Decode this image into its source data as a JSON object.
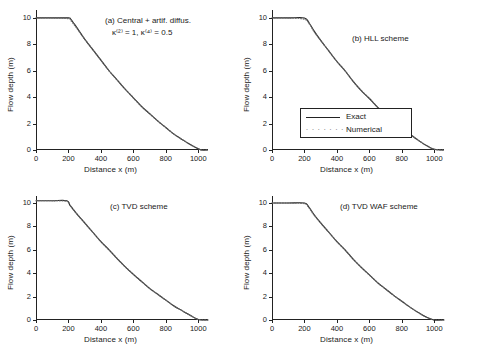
{
  "figure": {
    "background": "#ffffff",
    "line_color": "#222222",
    "marker_color": "#666666"
  },
  "axes": {
    "xlabel": "Distance x (m)",
    "ylabel": "Flow depth (m)",
    "xticks": [
      "0",
      "200",
      "400",
      "600",
      "800",
      "1000"
    ],
    "yticks": [
      "0",
      "2",
      "4",
      "6",
      "8",
      "10"
    ],
    "xlim": [
      0,
      1060
    ],
    "ylim": [
      0,
      10.6
    ]
  },
  "panels": [
    {
      "id": "a",
      "label": "(a) Central + artif. diffus.",
      "sublabel": "κ⁽²⁾ = 1, κ⁽⁴⁾ = 0.5",
      "has_legend": false
    },
    {
      "id": "b",
      "label": "(b) HLL scheme",
      "sublabel": "",
      "has_legend": true
    },
    {
      "id": "c",
      "label": "(c) TVD scheme",
      "sublabel": "",
      "has_legend": false
    },
    {
      "id": "d",
      "label": "(d) TVD WAF scheme",
      "sublabel": "",
      "has_legend": false
    }
  ],
  "legend": {
    "entries": [
      {
        "label": "Exact",
        "style": "line"
      },
      {
        "label": "Numerical",
        "style": "dots"
      }
    ]
  },
  "chart_data": {
    "type": "line",
    "title": "",
    "xlabel": "Distance x (m)",
    "ylabel": "Flow depth (m)",
    "xlim": [
      0,
      1060
    ],
    "ylim": [
      0,
      10.6
    ],
    "grid": false,
    "legend_position": "panel-b-center-left",
    "panels": [
      {
        "id": "a",
        "label": "(a) Central + artif. diffus.",
        "sublabel": "κ⁽²⁾ = 1, κ⁽⁴⁾ = 0.5",
        "series": [
          {
            "name": "Exact",
            "style": "solid-line",
            "x": [
              0,
              100,
              200,
              215,
              250,
              300,
              350,
              400,
              450,
              500,
              550,
              600,
              650,
              700,
              750,
              800,
              850,
              900,
              950,
              1000,
              1020,
              1060
            ],
            "y": [
              10.0,
              10.0,
              10.0,
              9.9,
              9.3,
              8.4,
              7.6,
              6.8,
              6.0,
              5.3,
              4.6,
              3.95,
              3.3,
              2.75,
              2.2,
              1.7,
              1.2,
              0.8,
              0.42,
              0.1,
              0.0,
              0.0
            ]
          },
          {
            "name": "Numerical",
            "style": "dotted-markers",
            "x": [
              0,
              100,
              200,
              215,
              250,
              300,
              350,
              400,
              450,
              500,
              550,
              600,
              650,
              700,
              750,
              800,
              850,
              900,
              950,
              1000,
              1020,
              1060
            ],
            "y": [
              10.0,
              10.0,
              9.95,
              9.8,
              9.25,
              8.4,
              7.6,
              6.8,
              6.0,
              5.3,
              4.6,
              3.95,
              3.3,
              2.75,
              2.2,
              1.7,
              1.2,
              0.8,
              0.42,
              0.1,
              0.0,
              0.0
            ]
          }
        ]
      },
      {
        "id": "b",
        "label": "(b) HLL scheme",
        "sublabel": "",
        "series": [
          {
            "name": "Exact",
            "style": "solid-line",
            "x": [
              0,
              100,
              200,
              230,
              260,
              300,
              350,
              400,
              450,
              500,
              550,
              600,
              650,
              700,
              750,
              800,
              850,
              900,
              950,
              1000,
              1060
            ],
            "y": [
              10.0,
              10.0,
              10.0,
              9.6,
              9.0,
              8.3,
              7.5,
              6.7,
              6.0,
              5.2,
              4.5,
              3.9,
              3.25,
              2.7,
              2.15,
              1.65,
              1.2,
              0.75,
              0.35,
              0.05,
              0.0
            ]
          },
          {
            "name": "Numerical",
            "style": "dotted-markers",
            "x": [
              0,
              100,
              200,
              230,
              260,
              300,
              350,
              400,
              450,
              500,
              550,
              600,
              650,
              700,
              750,
              800,
              850,
              900,
              950,
              1000,
              1060
            ],
            "y": [
              10.0,
              10.0,
              9.9,
              9.55,
              8.95,
              8.3,
              7.5,
              6.7,
              6.0,
              5.2,
              4.5,
              3.9,
              3.25,
              2.7,
              2.15,
              1.65,
              1.2,
              0.75,
              0.35,
              0.05,
              0.0
            ]
          }
        ]
      },
      {
        "id": "c",
        "label": "(c) TVD scheme",
        "sublabel": "",
        "series": [
          {
            "name": "Exact",
            "style": "solid-line",
            "x": [
              0,
              100,
              190,
              210,
              250,
              300,
              350,
              400,
              450,
              500,
              550,
              600,
              650,
              700,
              750,
              800,
              850,
              900,
              950,
              1000,
              1060
            ],
            "y": [
              10.2,
              10.2,
              10.2,
              9.8,
              9.1,
              8.3,
              7.5,
              6.7,
              6.0,
              5.25,
              4.55,
              3.9,
              3.3,
              2.7,
              2.2,
              1.7,
              1.2,
              0.8,
              0.4,
              0.05,
              0.0
            ]
          },
          {
            "name": "Numerical",
            "style": "dotted-markers",
            "x": [
              0,
              100,
              190,
              210,
              250,
              300,
              350,
              400,
              450,
              500,
              550,
              600,
              650,
              700,
              750,
              800,
              850,
              900,
              950,
              1000,
              1060
            ],
            "y": [
              10.2,
              10.2,
              10.15,
              9.8,
              9.1,
              8.3,
              7.5,
              6.7,
              6.0,
              5.25,
              4.55,
              3.9,
              3.3,
              2.7,
              2.2,
              1.7,
              1.2,
              0.8,
              0.4,
              0.05,
              0.0
            ]
          }
        ]
      },
      {
        "id": "d",
        "label": "(d) TVD WAF scheme",
        "sublabel": "",
        "series": [
          {
            "name": "Exact",
            "style": "solid-line",
            "x": [
              0,
              100,
              200,
              225,
              260,
              300,
              350,
              400,
              450,
              500,
              550,
              600,
              650,
              700,
              750,
              800,
              850,
              900,
              950,
              1000,
              1060
            ],
            "y": [
              10.0,
              10.0,
              10.0,
              9.7,
              9.0,
              8.3,
              7.5,
              6.7,
              6.0,
              5.2,
              4.5,
              3.85,
              3.2,
              2.65,
              2.1,
              1.6,
              1.1,
              0.65,
              0.25,
              0.0,
              0.0
            ]
          },
          {
            "name": "Numerical",
            "style": "dotted-markers",
            "x": [
              0,
              100,
              200,
              225,
              260,
              300,
              350,
              400,
              450,
              500,
              550,
              600,
              650,
              700,
              750,
              800,
              850,
              900,
              950,
              1000,
              1060
            ],
            "y": [
              10.0,
              10.0,
              9.95,
              9.65,
              8.95,
              8.3,
              7.5,
              6.7,
              6.0,
              5.2,
              4.5,
              3.85,
              3.2,
              2.65,
              2.1,
              1.6,
              1.1,
              0.65,
              0.25,
              0.0,
              0.0
            ]
          }
        ]
      }
    ]
  }
}
